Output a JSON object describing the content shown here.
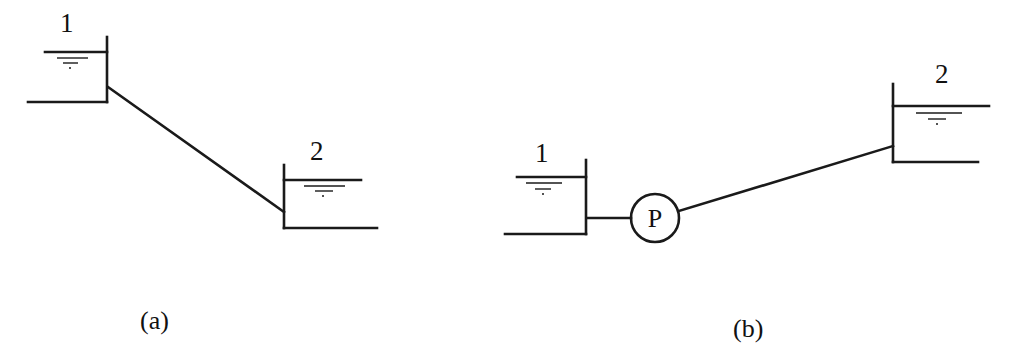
{
  "diagram": {
    "type": "hydraulic-schematic",
    "panels": [
      {
        "id": "a",
        "caption": "(a)",
        "reservoirs": [
          {
            "label": "1",
            "position": "upper-left"
          },
          {
            "label": "2",
            "position": "lower-right"
          }
        ],
        "connection": "gravity pipe from reservoir 1 down to reservoir 2"
      },
      {
        "id": "b",
        "caption": "(b)",
        "reservoirs": [
          {
            "label": "1",
            "position": "lower-left"
          },
          {
            "label": "2",
            "position": "upper-right"
          }
        ],
        "pump": {
          "label": "P"
        },
        "connection": "pipe from reservoir 1 through pump P up to reservoir 2"
      }
    ]
  },
  "labels": {
    "a_tank1": "1",
    "a_tank2": "2",
    "a_caption": "(a)",
    "b_tank1": "1",
    "b_tank2": "2",
    "b_pump": "P",
    "b_caption": "(b)"
  },
  "colors": {
    "ink": "#1a1a1a",
    "background": "#ffffff"
  }
}
